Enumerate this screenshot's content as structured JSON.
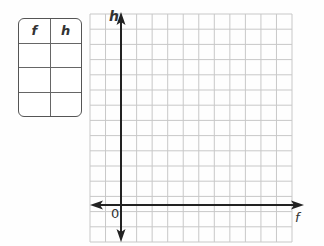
{
  "table": {
    "headers": [
      "f",
      "h"
    ],
    "rows": [
      [
        "",
        ""
      ],
      [
        "",
        ""
      ],
      [
        "",
        ""
      ]
    ]
  },
  "graph": {
    "y_axis_label": "h",
    "x_axis_label": "f",
    "origin_label": "0",
    "grid_color": "#c8c8c8",
    "axis_color": "#222222",
    "columns": 13,
    "rows": 15
  }
}
